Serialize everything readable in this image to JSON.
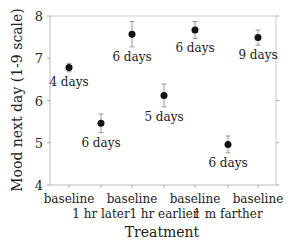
{
  "chart_data": {
    "type": "scatter",
    "title": "",
    "xlabel": "Treatment",
    "ylabel": "Mood next day (1-9 scale)",
    "ylim": [
      4,
      8
    ],
    "yticks": [
      4,
      5,
      6,
      7,
      8
    ],
    "grid": false,
    "legend": null,
    "x_tick_labels": [
      {
        "line1": "baseline",
        "line2": ""
      },
      {
        "line1": "",
        "line2": "1 hr later"
      },
      {
        "line1": "baseline",
        "line2": ""
      },
      {
        "line1": "",
        "line2": "1 hr earlier"
      },
      {
        "line1": "baseline",
        "line2": ""
      },
      {
        "line1": "",
        "line2": "1 m farther"
      },
      {
        "line1": "baseline",
        "line2": ""
      }
    ],
    "categories": [
      "baseline",
      "1 hr later",
      "baseline",
      "1 hr earlier",
      "baseline",
      "1 m farther",
      "baseline"
    ],
    "values": [
      6.78,
      5.46,
      7.57,
      6.12,
      7.67,
      4.96,
      7.49
    ],
    "error": [
      0.1,
      0.22,
      0.3,
      0.27,
      0.2,
      0.2,
      0.18
    ],
    "annotations": [
      "4 days",
      "6 days",
      "6 days",
      "5 days",
      "6 days",
      "6 days",
      "9 days"
    ],
    "annotation_position": [
      "below",
      "below",
      "below",
      "below",
      "below",
      "below",
      "below"
    ]
  }
}
